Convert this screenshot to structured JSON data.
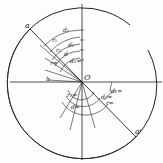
{
  "figure": {
    "center_label": "O",
    "points": [
      {
        "label": "a",
        "x": 30,
        "y": 29
      },
      {
        "label": "a'",
        "x": 136,
        "y": 137
      }
    ],
    "radial_labels": [
      {
        "text": "d₁",
        "x": 65,
        "y": 31
      },
      {
        "text": "r₁",
        "x": 54,
        "y": 42
      },
      {
        "text": "d₂",
        "x": 70,
        "y": 46
      },
      {
        "text": "r₂",
        "x": 58,
        "y": 52
      },
      {
        "text": "d",
        "x": 66,
        "y": 55
      },
      {
        "text": "d₃≈",
        "x": 72,
        "y": 62
      },
      {
        "text": "r≈",
        "x": 52,
        "y": 64
      },
      {
        "text": "b",
        "x": 48,
        "y": 81
      },
      {
        "text": "r₂≈",
        "x": 69,
        "y": 96
      },
      {
        "text": "d≈",
        "x": 73,
        "y": 108
      },
      {
        "text": "d₂≈",
        "x": 103,
        "y": 98
      },
      {
        "text": "r≈",
        "x": 108,
        "y": 104
      },
      {
        "text": "d₁≈",
        "x": 113,
        "y": 92
      }
    ],
    "colors": {
      "ink": "#222222",
      "paper": "#fdfdfd"
    }
  }
}
